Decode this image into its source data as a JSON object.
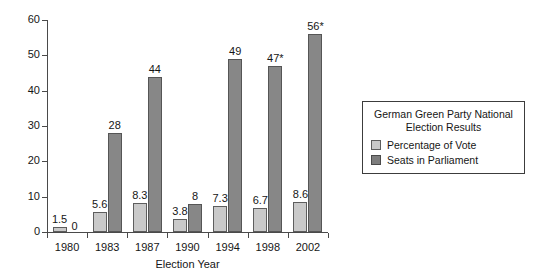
{
  "chart_data": {
    "type": "bar",
    "title": "",
    "categories": [
      "1980",
      "1983",
      "1987",
      "1990",
      "1994",
      "1998",
      "2002"
    ],
    "series": [
      {
        "name": "Percentage of Vote",
        "color": "#c9c9c9",
        "values": [
          1.5,
          5.6,
          8.3,
          3.8,
          7.3,
          6.7,
          8.6
        ],
        "labels": [
          "1.5",
          "5.6",
          "8.3",
          "3.8",
          "7.3",
          "6.7",
          "8.6"
        ]
      },
      {
        "name": "Seats in Parliament",
        "color": "#878787",
        "values": [
          0,
          28,
          44,
          8,
          49,
          47,
          56
        ],
        "labels": [
          "0",
          "28",
          "44",
          "8",
          "49",
          "47*",
          "56*"
        ]
      }
    ],
    "xlabel": "Election Year",
    "ylabel": "",
    "ylim": [
      0,
      60
    ],
    "yticks": [
      0,
      10,
      20,
      30,
      40,
      50,
      60
    ],
    "ytick_labels": [
      "0",
      "10",
      "20",
      "30",
      "40",
      "50",
      "60"
    ],
    "grid": false,
    "legend_position": "right"
  },
  "legend": {
    "title_line1": "German Green Party National",
    "title_line2": "Election Results",
    "entries": [
      {
        "label": "Percentage of Vote",
        "swatch": "vote-swatch"
      },
      {
        "label": "Seats in Parliament",
        "swatch": "seats-swatch"
      }
    ]
  },
  "axes": {
    "x_title": "Election Year"
  }
}
